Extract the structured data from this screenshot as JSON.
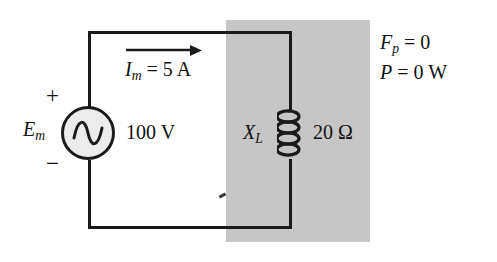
{
  "figure": {
    "kind": "ac-circuit-schematic"
  },
  "colors": {
    "wire": "#1a1a1a",
    "shade_region": "#c6c6c6",
    "source_fill": "#ececec",
    "background": "#ffffff",
    "text": "#111111"
  },
  "source": {
    "symbol_name": "ac-voltage-source",
    "label_main": "E",
    "label_sub": "m",
    "polarity_plus": "+",
    "polarity_minus": "−",
    "value": "100 V"
  },
  "current": {
    "arrow_direction": "right",
    "label_main": "I",
    "label_sub": "m",
    "label_value": "= 5 A",
    "full_text": "I_m = 5 A"
  },
  "inductor": {
    "symbol_name": "inductor-coil",
    "loops": 4,
    "label_main": "X",
    "label_sub": "L",
    "value": "20 Ω"
  },
  "annotations": [
    {
      "name": "power-factor",
      "label_main": "F",
      "label_sub": "p",
      "label_value": "= 0",
      "full_text": "F_p = 0"
    },
    {
      "name": "real-power",
      "label_main": "P",
      "label_sub": "",
      "label_value": "= 0 W",
      "full_text": "P = 0 W"
    }
  ]
}
